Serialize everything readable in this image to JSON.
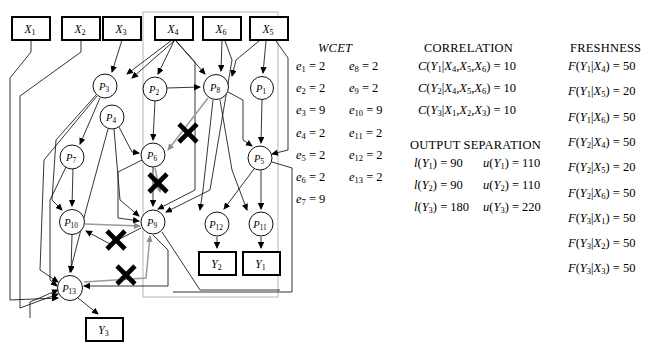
{
  "figure": {
    "type": "task-graph-diagram",
    "group_box": {
      "x": 143,
      "y": 12,
      "w": 135,
      "h": 285,
      "stroke": "#b9b9b9"
    }
  },
  "graph": {
    "input_boxes": [
      {
        "id": "X1",
        "label": "X",
        "sub": "1",
        "x": 12,
        "y": 17,
        "w": 38,
        "h": 23
      },
      {
        "id": "X2",
        "label": "X",
        "sub": "2",
        "x": 62,
        "y": 17,
        "w": 38,
        "h": 23
      },
      {
        "id": "X3",
        "label": "X",
        "sub": "3",
        "x": 103,
        "y": 17,
        "w": 38,
        "h": 23
      },
      {
        "id": "X4",
        "label": "X",
        "sub": "4",
        "x": 155,
        "y": 17,
        "w": 38,
        "h": 23
      },
      {
        "id": "X6",
        "label": "X",
        "sub": "6",
        "x": 203,
        "y": 17,
        "w": 38,
        "h": 23
      },
      {
        "id": "X5",
        "label": "X",
        "sub": "5",
        "x": 250,
        "y": 17,
        "w": 38,
        "h": 23
      }
    ],
    "output_boxes": [
      {
        "id": "Y2",
        "label": "Y",
        "sub": "2",
        "x": 199,
        "y": 252,
        "w": 37,
        "h": 23
      },
      {
        "id": "Y1",
        "label": "Y",
        "sub": "1",
        "x": 243,
        "y": 252,
        "w": 37,
        "h": 23
      },
      {
        "id": "Y3",
        "label": "Y",
        "sub": "3",
        "x": 86,
        "y": 318,
        "w": 37,
        "h": 23
      }
    ],
    "process_nodes": [
      {
        "id": "P3",
        "label": "P",
        "sub": "3",
        "cx": 105,
        "cy": 86,
        "r": 12
      },
      {
        "id": "P2",
        "label": "P",
        "sub": "2",
        "cx": 155,
        "cy": 89,
        "r": 12
      },
      {
        "id": "P8",
        "label": "P",
        "sub": "8",
        "cx": 216,
        "cy": 87,
        "r": 12.5
      },
      {
        "id": "P1",
        "label": "P",
        "sub": "1",
        "cx": 262,
        "cy": 88,
        "r": 11.5
      },
      {
        "id": "P4",
        "label": "P",
        "sub": "4",
        "cx": 112,
        "cy": 117,
        "r": 12
      },
      {
        "id": "P6",
        "label": "P",
        "sub": "6",
        "cx": 153,
        "cy": 155,
        "r": 12
      },
      {
        "id": "P7",
        "label": "P",
        "sub": "7",
        "cx": 72,
        "cy": 157,
        "r": 12
      },
      {
        "id": "P5",
        "label": "P",
        "sub": "5",
        "cx": 260,
        "cy": 158,
        "r": 12
      },
      {
        "id": "P10",
        "label": "P",
        "sub": "10",
        "cx": 72,
        "cy": 222,
        "r": 12.5
      },
      {
        "id": "P9",
        "label": "P",
        "sub": "9",
        "cx": 153,
        "cy": 222,
        "r": 12
      },
      {
        "id": "P12",
        "label": "P",
        "sub": "12",
        "cx": 217,
        "cy": 224,
        "r": 12
      },
      {
        "id": "P11",
        "label": "P",
        "sub": "11",
        "cx": 261,
        "cy": 224,
        "r": 12
      },
      {
        "id": "P13",
        "label": "P",
        "sub": "13",
        "cx": 70,
        "cy": 288,
        "r": 12.5
      }
    ],
    "cancel_marks": [
      {
        "x": 188,
        "y": 133
      },
      {
        "x": 158,
        "y": 183
      },
      {
        "x": 116,
        "y": 240
      },
      {
        "x": 126,
        "y": 275
      }
    ]
  },
  "wcet": {
    "title": "WCET",
    "col1": [
      {
        "lhs": "e",
        "sub": "1",
        "value": "2"
      },
      {
        "lhs": "e",
        "sub": "2",
        "value": "2"
      },
      {
        "lhs": "e",
        "sub": "3",
        "value": "9"
      },
      {
        "lhs": "e",
        "sub": "4",
        "value": "2"
      },
      {
        "lhs": "e",
        "sub": "5",
        "value": "2"
      },
      {
        "lhs": "e",
        "sub": "6",
        "value": "2"
      },
      {
        "lhs": "e",
        "sub": "7",
        "value": "9"
      }
    ],
    "col2": [
      {
        "lhs": "e",
        "sub": "8",
        "value": "2"
      },
      {
        "lhs": "e",
        "sub": "9",
        "value": "2"
      },
      {
        "lhs": "e",
        "sub": "10",
        "value": "9"
      },
      {
        "lhs": "e",
        "sub": "11",
        "value": "2"
      },
      {
        "lhs": "e",
        "sub": "12",
        "value": "2"
      },
      {
        "lhs": "e",
        "sub": "13",
        "value": "2"
      }
    ]
  },
  "correlation": {
    "title": "CORRELATION",
    "rows": [
      {
        "fn": "C",
        "out": "Y",
        "out_sub": "1",
        "args": [
          {
            "v": "X",
            "s": "4"
          },
          {
            "v": "X",
            "s": "5"
          },
          {
            "v": "X",
            "s": "6"
          }
        ],
        "value": "10"
      },
      {
        "fn": "C",
        "out": "Y",
        "out_sub": "2",
        "args": [
          {
            "v": "X",
            "s": "4"
          },
          {
            "v": "X",
            "s": "5"
          },
          {
            "v": "X",
            "s": "6"
          }
        ],
        "value": "10"
      },
      {
        "fn": "C",
        "out": "Y",
        "out_sub": "3",
        "args": [
          {
            "v": "X",
            "s": "1"
          },
          {
            "v": "X",
            "s": "2"
          },
          {
            "v": "X",
            "s": "3"
          }
        ],
        "value": "10"
      }
    ]
  },
  "output_separation": {
    "title": "OUTPUT SEPARATION",
    "rows": [
      {
        "lower_fn": "l",
        "lower_arg": "Y",
        "lower_sub": "1",
        "lower_value": "90",
        "upper_fn": "u",
        "upper_arg": "Y",
        "upper_sub": "1",
        "upper_value": "110"
      },
      {
        "lower_fn": "l",
        "lower_arg": "Y",
        "lower_sub": "2",
        "lower_value": "90",
        "upper_fn": "u",
        "upper_arg": "Y",
        "upper_sub": "2",
        "upper_value": "110"
      },
      {
        "lower_fn": "l",
        "lower_arg": "Y",
        "lower_sub": "3",
        "lower_value": "180",
        "upper_fn": "u",
        "upper_arg": "Y",
        "upper_sub": "3",
        "upper_value": "220"
      }
    ]
  },
  "freshness": {
    "title": "FRESHNESS",
    "rows": [
      {
        "fn": "F",
        "out": "Y",
        "out_sub": "1",
        "arg": "X",
        "arg_sub": "4",
        "value": "50"
      },
      {
        "fn": "F",
        "out": "Y",
        "out_sub": "1",
        "arg": "X",
        "arg_sub": "5",
        "value": "20"
      },
      {
        "fn": "F",
        "out": "Y",
        "out_sub": "1",
        "arg": "X",
        "arg_sub": "6",
        "value": "50"
      },
      {
        "fn": "F",
        "out": "Y",
        "out_sub": "2",
        "arg": "X",
        "arg_sub": "4",
        "value": "50"
      },
      {
        "fn": "F",
        "out": "Y",
        "out_sub": "2",
        "arg": "X",
        "arg_sub": "5",
        "value": "20"
      },
      {
        "fn": "F",
        "out": "Y",
        "out_sub": "2",
        "arg": "X",
        "arg_sub": "6",
        "value": "50"
      },
      {
        "fn": "F",
        "out": "Y",
        "out_sub": "3",
        "arg": "X",
        "arg_sub": "1",
        "value": "50"
      },
      {
        "fn": "F",
        "out": "Y",
        "out_sub": "3",
        "arg": "X",
        "arg_sub": "2",
        "value": "50"
      },
      {
        "fn": "F",
        "out": "Y",
        "out_sub": "3",
        "arg": "X",
        "arg_sub": "3",
        "value": "50"
      }
    ]
  }
}
